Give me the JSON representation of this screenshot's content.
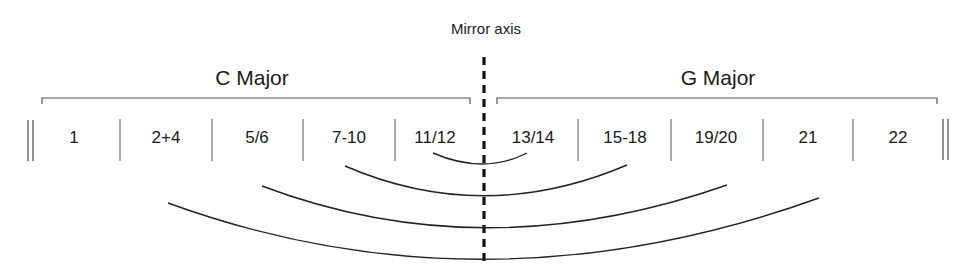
{
  "diagram": {
    "mirror_label": "Mirror axis",
    "left_group": {
      "label": "C Major"
    },
    "right_group": {
      "label": "G Major"
    },
    "cells": [
      {
        "label": "1",
        "x": 74
      },
      {
        "label": "2+4",
        "x": 166
      },
      {
        "label": "5/6",
        "x": 257
      },
      {
        "label": "7-10",
        "x": 349
      },
      {
        "label": "11/12",
        "x": 434
      },
      {
        "label": "13/14",
        "x": 532
      },
      {
        "label": "15-18",
        "x": 624
      },
      {
        "label": "19/20",
        "x": 717
      },
      {
        "label": "21",
        "x": 808
      },
      {
        "label": "22",
        "x": 898
      }
    ],
    "arcs": [
      {
        "from": "11/12",
        "to": "13/14"
      },
      {
        "from": "7-10",
        "to": "15-18"
      },
      {
        "from": "5/6",
        "to": "19/20"
      },
      {
        "from": "2+4",
        "to": "21"
      }
    ]
  }
}
